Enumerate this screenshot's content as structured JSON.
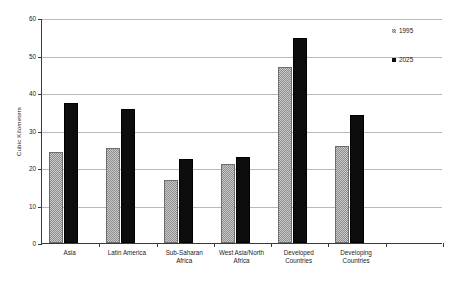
{
  "chart_data": {
    "type": "bar",
    "title": "",
    "xlabel": "",
    "ylabel": "Cubic Kilometers",
    "ylim": [
      0,
      60
    ],
    "yticks": [
      0,
      10,
      20,
      30,
      40,
      50,
      60
    ],
    "ytick_labels": [
      "0",
      "10",
      "20",
      "30",
      "40",
      "50",
      "60"
    ],
    "grid": true,
    "legend_position": "right",
    "categories": [
      "Asia",
      "Latin America",
      "Sub-Saharan Africa",
      "West Asia/North Africa",
      "Developed Countries",
      "Developing Countries"
    ],
    "category_lines": [
      [
        "Asia"
      ],
      [
        "Latin America"
      ],
      [
        "Sub-Saharan",
        "Africa"
      ],
      [
        "West Asia/North",
        "Africa"
      ],
      [
        "Developed",
        "Countries"
      ],
      [
        "Developing",
        "Countries"
      ]
    ],
    "series": [
      {
        "name": "1995",
        "color": "#8c8c8c",
        "values": [
          24.3,
          25.3,
          16.8,
          21.0,
          47.0,
          25.9
        ]
      },
      {
        "name": "2025",
        "color": "#0d0d0d",
        "values": [
          37.4,
          35.8,
          22.4,
          22.9,
          54.6,
          34.2
        ]
      }
    ]
  }
}
